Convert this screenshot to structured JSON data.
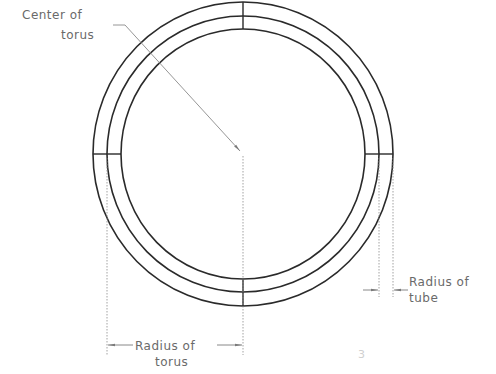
{
  "diagram": {
    "labels": {
      "center_line1": "Center of",
      "center_line2": "torus",
      "torus_radius_line1": "Radius of",
      "torus_radius_line2": "torus",
      "tube_radius_line1": "Radius of",
      "tube_radius_line2": "tube",
      "stray_mark": "3"
    },
    "geometry": {
      "center": [
        242,
        154
      ],
      "outer_radii": [
        151,
        152
      ],
      "mid_radii": [
        134,
        138
      ],
      "inner_radii": [
        121,
        125
      ]
    },
    "colors": {
      "stroke": "#2a2a2a",
      "dim_line": "#8a8a8a",
      "text": "#6a6a6a"
    }
  }
}
